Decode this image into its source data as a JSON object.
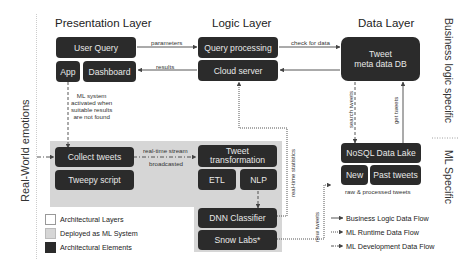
{
  "layers": {
    "presentation": "Presentation Layer",
    "logic": "Logic Layer",
    "data": "Data Layer"
  },
  "side_labels": {
    "left": "Real-World emotions",
    "right_top": "Business logic specific",
    "right_bottom": "ML Specific"
  },
  "boxes": {
    "user_query": "User Query",
    "app": "App",
    "dashboard": "Dashboard",
    "query_processing": "Query processing",
    "cloud_server": "Cloud server",
    "tweet_db": "Tweet\nmeta data DB",
    "collect_tweets": "Collect tweets",
    "tweepy_script": "Tweepy script",
    "tweet_transformation": "Tweet\ntransformation",
    "etl": "ETL",
    "nlp": "NLP",
    "dnn_classifier": "DNN Classifier",
    "snow_labs": "Snow Labs*",
    "nosql_lake": "NoSQL Data Lake",
    "new": "New",
    "past_tweets": "Past tweets"
  },
  "edge_labels": {
    "parameters": "parameters",
    "results": "results",
    "check_for_data": "check for data",
    "ml_activated": "ML system\nactivated when\nsuitable results\nare not found",
    "realtime_stream": "real-time stream",
    "broadcasted": "broadcasted",
    "realtime_statistics": "real-time statistics",
    "search_tweets": "search tweets",
    "get_tweets": "get tweets",
    "new_tweets": "new tweets",
    "raw_processed": "raw & processed tweets"
  },
  "legend": {
    "swatches": [
      {
        "label": "Architectural Layers",
        "color": "#ffffff"
      },
      {
        "label": "Deployed as ML System",
        "color": "#d6d6d6"
      },
      {
        "label": "Architectural Elements",
        "color": "#2b2b2b"
      }
    ],
    "flows": [
      {
        "label": "Business Logic Data Flow",
        "style": "solid"
      },
      {
        "label": "ML Runtime Data Flow",
        "style": "dotted"
      },
      {
        "label": "ML Development Data Flow",
        "style": "dashdot"
      }
    ]
  },
  "colors": {
    "element": "#2b2b2b",
    "ml_panel": "#d6d6d6",
    "line": "#444444"
  }
}
